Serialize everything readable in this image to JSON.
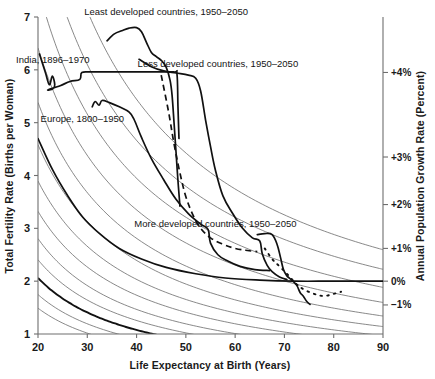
{
  "chart_data": {
    "type": "line",
    "title": "",
    "xlabel": "Life Expectancy at Birth (Years)",
    "ylabel": "Total Fertility Rate (Births per Woman)",
    "y2label": "Annual Population Growth Rate (Percent)",
    "xlim": [
      20,
      90
    ],
    "ylim": [
      1,
      7
    ],
    "xticks": [
      20,
      30,
      40,
      50,
      60,
      70,
      80,
      90
    ],
    "xtick_labels": [
      "20",
      "30",
      "40",
      "50",
      "60",
      "70",
      "80",
      "90"
    ],
    "yticks": [
      1,
      2,
      3,
      4,
      5,
      6,
      7
    ],
    "ytick_labels": [
      "1",
      "2",
      "3",
      "4",
      "5",
      "6",
      "7"
    ],
    "grid": true,
    "grid_type": "iso-growth-rate hyperbolic contours",
    "legend_position": "inline annotations on curves",
    "right_axis_ticks": [
      {
        "label": "+4%",
        "y_fertility": 5.95
      },
      {
        "label": "+3%",
        "y_fertility": 4.35
      },
      {
        "label": "+2%",
        "y_fertility": 3.45
      },
      {
        "label": "+1%",
        "y_fertility": 2.62
      },
      {
        "label": "0%",
        "y_fertility": 2.0
      },
      {
        "label": "−1%",
        "y_fertility": 1.55
      }
    ],
    "iso_lines": [
      {
        "label": "+5%",
        "bold": false,
        "k": 182
      },
      {
        "label": "+4.5%",
        "bold": false,
        "k": 156
      },
      {
        "label": "+4%",
        "bold": false,
        "k": 132
      },
      {
        "label": "+3.5%",
        "bold": false,
        "k": 112
      },
      {
        "label": "+3%",
        "bold": false,
        "k": 94
      },
      {
        "label": "+2.5%",
        "bold": false,
        "k": 80
      },
      {
        "label": "+2%",
        "bold": false,
        "k": 68
      },
      {
        "label": "+1.5%",
        "bold": false,
        "k": 58
      },
      {
        "label": "+1%",
        "bold": false,
        "k": 49
      },
      {
        "label": "+0.5%",
        "bold": false,
        "k": 42
      },
      {
        "label": "0%",
        "bold": true,
        "k": 36
      },
      {
        "label": "-0.5%",
        "bold": false,
        "k": 30.5
      },
      {
        "label": "-1%",
        "bold": false,
        "k": 26
      }
    ],
    "series": [
      {
        "name": "Least developed countries, 1950–2050",
        "label": "Least developed countries, 1950–2050",
        "style": "solid",
        "label_x": 46,
        "label_y": 7.03,
        "points": [
          [
            34.0,
            6.55
          ],
          [
            35.5,
            6.68
          ],
          [
            37.0,
            6.74
          ],
          [
            38.5,
            6.79
          ],
          [
            40.0,
            6.8
          ],
          [
            41.0,
            6.72
          ],
          [
            42.0,
            6.52
          ],
          [
            43.0,
            6.33
          ],
          [
            44.0,
            6.25
          ],
          [
            45.0,
            6.18
          ],
          [
            46.0,
            6.05
          ],
          [
            46.8,
            5.8
          ],
          [
            47.2,
            5.52
          ],
          [
            47.6,
            5.0
          ],
          [
            48.0,
            4.45
          ],
          [
            48.4,
            3.9
          ],
          [
            48.8,
            3.42
          ]
        ]
      },
      {
        "name": "Less developed countries, 1950–2050",
        "label": "Less developed countries, 1950–2050",
        "style": "solid",
        "label_x": 56.5,
        "label_y": 6.05,
        "points": [
          [
            40.5,
            6.2
          ],
          [
            43.0,
            6.06
          ],
          [
            45.5,
            5.98
          ],
          [
            48.0,
            5.94
          ],
          [
            50.5,
            5.9
          ],
          [
            52.0,
            5.84
          ],
          [
            53.0,
            5.6
          ],
          [
            54.0,
            5.05
          ],
          [
            55.0,
            4.55
          ],
          [
            56.0,
            4.1
          ],
          [
            57.5,
            3.62
          ],
          [
            59.5,
            3.28
          ],
          [
            61.5,
            3.0
          ],
          [
            63.5,
            2.82
          ],
          [
            65.0,
            2.76
          ],
          [
            65.5,
            2.52
          ],
          [
            66.5,
            2.3
          ],
          [
            67.5,
            2.18
          ],
          [
            69.0,
            2.08
          ],
          [
            70.5,
            2.03
          ]
        ]
      },
      {
        "name": "More developed countries, 1950–2050",
        "label": "More developed countries, 1950–2050",
        "style": "solid-then-dotted",
        "label_x": 56,
        "label_y": 3.02,
        "points": [
          [
            64.5,
            2.88
          ],
          [
            66.0,
            2.9
          ],
          [
            67.5,
            2.88
          ],
          [
            68.5,
            2.7
          ],
          [
            69.2,
            2.45
          ],
          [
            69.8,
            2.22
          ],
          [
            70.5,
            2.1
          ],
          [
            71.5,
            2.02
          ],
          [
            72.5,
            1.92
          ],
          [
            73.2,
            1.78
          ],
          [
            73.8,
            1.72
          ],
          [
            74.5,
            1.62
          ],
          [
            75.2,
            1.56
          ]
        ],
        "dotted_points": [
          [
            66.0,
            2.62
          ],
          [
            67.5,
            2.42
          ],
          [
            69.0,
            2.28
          ],
          [
            70.5,
            2.14
          ],
          [
            72.5,
            1.94
          ],
          [
            74.0,
            1.84
          ],
          [
            76.0,
            1.76
          ],
          [
            78.0,
            1.72
          ],
          [
            80.0,
            1.76
          ],
          [
            81.5,
            1.8
          ]
        ]
      },
      {
        "name": "India, 1896–1970",
        "label": "India, 1896–1970",
        "style": "solid",
        "label_x": 23,
        "label_y": 6.12,
        "points": [
          [
            20.3,
            6.3
          ],
          [
            21.5,
            5.95
          ],
          [
            22.3,
            5.72
          ],
          [
            22.9,
            5.88
          ],
          [
            23.4,
            5.72
          ],
          [
            23.0,
            5.64
          ],
          [
            22.0,
            5.62
          ],
          [
            24.5,
            5.7
          ],
          [
            26.5,
            5.78
          ],
          [
            28.5,
            5.82
          ],
          [
            28.9,
            5.95
          ],
          [
            31.0,
            5.96
          ],
          [
            36.0,
            5.96
          ],
          [
            42.0,
            5.96
          ],
          [
            47.5,
            5.96
          ],
          [
            48.2,
            5.92
          ],
          [
            48.4,
            5.3
          ],
          [
            48.6,
            4.7
          ]
        ]
      },
      {
        "name": "Europe, 1800–1950",
        "label": "Europe, 1800–1950",
        "style": "solid",
        "label_x": 29,
        "label_y": 5.02,
        "points": [
          [
            31.0,
            5.3
          ],
          [
            31.6,
            5.4
          ],
          [
            32.4,
            5.33
          ],
          [
            33.0,
            5.42
          ],
          [
            34.5,
            5.38
          ],
          [
            36.5,
            5.3
          ],
          [
            38.5,
            5.2
          ],
          [
            39.5,
            5.06
          ],
          [
            41.0,
            4.72
          ],
          [
            43.0,
            4.32
          ],
          [
            45.5,
            3.92
          ],
          [
            48.0,
            3.55
          ],
          [
            50.5,
            3.28
          ],
          [
            53.0,
            3.08
          ],
          [
            54.5,
            2.98
          ],
          [
            55.0,
            2.72
          ],
          [
            56.5,
            2.5
          ],
          [
            58.5,
            2.38
          ],
          [
            61.0,
            2.28
          ],
          [
            64.0,
            2.22
          ],
          [
            67.0,
            2.2
          ]
        ]
      },
      {
        "name": "Europe projection dashed",
        "label": "",
        "style": "dashed",
        "points": [
          [
            45.0,
            5.9
          ],
          [
            46.5,
            5.2
          ],
          [
            47.6,
            4.6
          ],
          [
            48.8,
            4.05
          ],
          [
            50.0,
            3.6
          ],
          [
            51.5,
            3.24
          ],
          [
            53.0,
            3.0
          ],
          [
            55.0,
            2.82
          ],
          [
            57.5,
            2.7
          ],
          [
            60.0,
            2.62
          ],
          [
            62.5,
            2.58
          ],
          [
            64.5,
            2.56
          ]
        ]
      },
      {
        "name": "Europe lower bold continuation",
        "label": "",
        "style": "solid-bold-lower",
        "points": [
          [
            20.0,
            4.7
          ],
          [
            23.0,
            4.1
          ],
          [
            26.0,
            3.62
          ],
          [
            29.0,
            3.22
          ],
          [
            32.5,
            2.9
          ],
          [
            36.5,
            2.62
          ],
          [
            41.0,
            2.42
          ],
          [
            46.0,
            2.26
          ],
          [
            52.0,
            2.14
          ],
          [
            58.0,
            2.06
          ],
          [
            65.0,
            2.02
          ],
          [
            72.0,
            2.0
          ],
          [
            80.0,
            2.0
          ],
          [
            90.0,
            2.0
          ]
        ]
      }
    ]
  },
  "axes": {
    "x_title": "Life Expectancy at Birth (Years)",
    "y_title": "Total Fertility Rate (Births per Woman)",
    "y2_title": "Annual Population Growth Rate (Percent)"
  }
}
